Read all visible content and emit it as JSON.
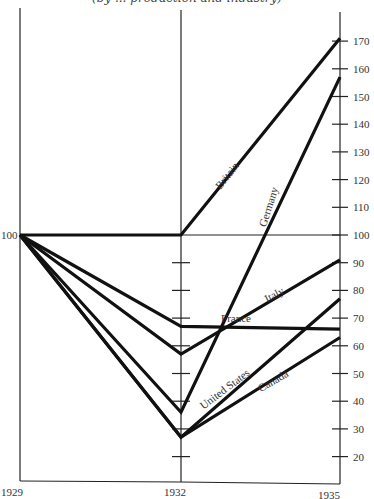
{
  "header": {
    "title": "(by ... production and industry)"
  },
  "chart_data": {
    "type": "line",
    "title": "(by ... production and industry)",
    "xlabel": "",
    "ylabel": "",
    "x": [
      "1929",
      "1932",
      "1935"
    ],
    "ylim": [
      15,
      175
    ],
    "right_axis_ticks": [
      20,
      30,
      40,
      50,
      60,
      70,
      80,
      90,
      100,
      110,
      120,
      130,
      140,
      150,
      160,
      170
    ],
    "left_axis_label": "100",
    "series": [
      {
        "name": "Britain",
        "values": [
          100,
          100,
          171
        ]
      },
      {
        "name": "Germany",
        "values": [
          100,
          36,
          157
        ]
      },
      {
        "name": "Italy",
        "values": [
          100,
          57,
          91
        ]
      },
      {
        "name": "France",
        "values": [
          100,
          67,
          66
        ]
      },
      {
        "name": "United States",
        "values": [
          100,
          27,
          77
        ]
      },
      {
        "name": "Canada",
        "values": [
          100,
          27,
          63
        ]
      }
    ],
    "grid": false,
    "legend": "inline labels along lines",
    "reference_line": 100
  },
  "colors": {
    "line": "#111111",
    "axis": "#222222",
    "text": "#333333",
    "background": "#ffffff"
  }
}
